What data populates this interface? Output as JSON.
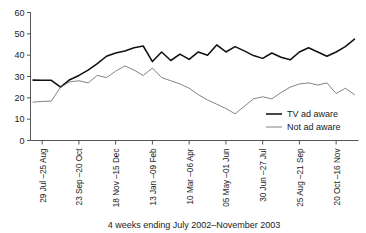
{
  "chart_data": {
    "type": "line",
    "title": "",
    "xlabel": "4 weeks ending July 2002–November 2003",
    "ylabel": "",
    "ylim": [
      0,
      60
    ],
    "yticks": [
      0,
      10,
      20,
      30,
      40,
      50,
      60
    ],
    "grid": false,
    "legend_position": "right-middle",
    "xtick_labels": [
      "29 Jul –25 Aug",
      "23 Sep –20 Oct",
      "18 Nov –15 Dec",
      "13 Jan –09 Feb",
      "10 Mar –06 Apr",
      "05 May –01 Jun",
      "30 Jun –27 Jul",
      "25 Aug –21 Sep",
      "20 Oct –16 Nov"
    ],
    "xtick_indices": [
      1,
      5,
      9,
      13,
      17,
      21,
      25,
      29,
      33
    ],
    "n_points": 36,
    "series": [
      {
        "name": "TV ad aware",
        "style": "thick",
        "color": "#111111",
        "values": [
          28.3,
          28.2,
          28.2,
          25.0,
          28.5,
          30.5,
          33.0,
          36.0,
          39.5,
          41.0,
          42.0,
          43.5,
          44.3,
          37.0,
          41.5,
          37.5,
          40.5,
          38.0,
          41.5,
          40.0,
          44.8,
          41.5,
          44.0,
          42.0,
          39.8,
          38.5,
          41.0,
          39.0,
          37.8,
          41.5,
          43.5,
          41.5,
          39.5,
          41.5,
          44.0,
          47.5
        ]
      },
      {
        "name": "Not ad aware",
        "style": "thin",
        "color": "#6b6b6b",
        "values": [
          18.0,
          18.3,
          18.5,
          25.0,
          27.5,
          28.0,
          27.0,
          30.5,
          29.5,
          32.5,
          35.0,
          33.0,
          30.5,
          34.0,
          29.5,
          28.0,
          26.5,
          24.5,
          21.5,
          19.0,
          17.0,
          15.0,
          12.5,
          16.0,
          19.5,
          20.5,
          19.5,
          22.5,
          25.0,
          26.5,
          27.0,
          26.0,
          27.0,
          22.0,
          24.5,
          21.5
        ]
      }
    ]
  },
  "legend": {
    "items": [
      {
        "label": "TV ad aware"
      },
      {
        "label": "Not ad aware"
      }
    ]
  },
  "axes": {
    "x_title": "4 weeks ending July 2002–November 2003"
  }
}
